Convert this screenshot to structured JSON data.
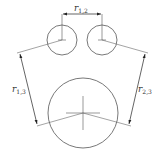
{
  "diagram": {
    "title": "",
    "colors": {
      "stroke": "#555555",
      "text": "#333333",
      "background": "#ffffff"
    },
    "circles": [
      {
        "id": "circle-1",
        "cx": 62,
        "cy": 40,
        "r": 15
      },
      {
        "id": "circle-2",
        "cx": 102,
        "cy": 40,
        "r": 15
      },
      {
        "id": "circle-3",
        "cx": 83,
        "cy": 113,
        "r": 35
      }
    ],
    "labels": {
      "r12": {
        "base": "r",
        "sub": "1,2"
      },
      "r13": {
        "base": "r",
        "sub": "1,3"
      },
      "r23": {
        "base": "r",
        "sub": "2,3"
      }
    }
  }
}
